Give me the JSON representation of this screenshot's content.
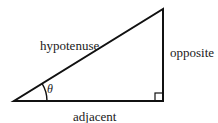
{
  "diagram": {
    "type": "right-triangle",
    "labels": {
      "hypotenuse": "hypotenuse",
      "opposite": "opposite",
      "adjacent": "adjacent",
      "angle": "θ"
    },
    "stroke_color": "#111111",
    "background": "#ffffff"
  }
}
